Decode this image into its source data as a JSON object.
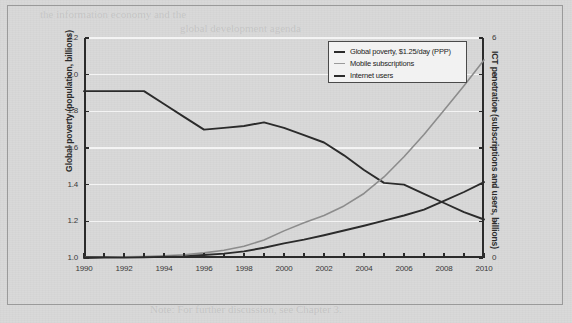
{
  "chart_data": {
    "type": "line",
    "title": "",
    "xlabel": "",
    "grid": "horizontal",
    "legend_position": "top-right",
    "x": [
      1990,
      1991,
      1992,
      1993,
      1994,
      1995,
      1996,
      1997,
      1998,
      1999,
      2000,
      2001,
      2002,
      2003,
      2004,
      2005,
      2006,
      2007,
      2008,
      2009,
      2010
    ],
    "xlim": [
      1990,
      2010
    ],
    "xticks": [
      1990,
      1992,
      1994,
      1996,
      1998,
      2000,
      2002,
      2004,
      2006,
      2008,
      2010
    ],
    "xtick_labels": [
      "1990",
      "1992",
      "1994",
      "1996",
      "1998",
      "2000",
      "2002",
      "2004",
      "2006",
      "2008",
      "2010"
    ],
    "axes": [
      {
        "id": "left",
        "label": "Global poverty (population, billions)",
        "lim": [
          1.0,
          2.2
        ],
        "ticks": [
          1.0,
          1.2,
          1.4,
          1.6,
          1.8,
          2.0,
          2.2
        ],
        "tick_labels": [
          "1.0",
          "1.2",
          "1.4",
          "1.6",
          "1.8",
          "2.0",
          "2.2"
        ]
      },
      {
        "id": "right",
        "label": "ICT penetration (subscriptions and users, billions)",
        "lim": [
          0,
          6
        ],
        "ticks": [
          0,
          1,
          2,
          3,
          4,
          5,
          6
        ],
        "tick_labels": [
          "0",
          "1",
          "2",
          "3",
          "4",
          "5",
          "6"
        ]
      }
    ],
    "series": [
      {
        "name": "Global poverty, $1.25/day (PPP)",
        "axis": "left",
        "color": "#2b2b2b",
        "width": 1.9,
        "values": [
          1.91,
          1.91,
          1.91,
          1.91,
          1.84,
          1.77,
          1.7,
          1.71,
          1.72,
          1.74,
          1.71,
          1.67,
          1.63,
          1.56,
          1.48,
          1.41,
          1.4,
          1.35,
          1.3,
          1.25,
          1.21
        ]
      },
      {
        "name": "Mobile subscriptions",
        "axis": "right",
        "color": "#8c8c8c",
        "width": 1.6,
        "values": [
          0.01,
          0.02,
          0.03,
          0.04,
          0.06,
          0.09,
          0.14,
          0.21,
          0.32,
          0.49,
          0.74,
          0.96,
          1.16,
          1.42,
          1.76,
          2.21,
          2.76,
          3.37,
          4.03,
          4.7,
          5.4
        ]
      },
      {
        "name": "Internet users",
        "axis": "right",
        "color": "#2b2b2b",
        "width": 1.9,
        "values": [
          0.0,
          0.01,
          0.01,
          0.02,
          0.03,
          0.04,
          0.08,
          0.12,
          0.18,
          0.28,
          0.4,
          0.5,
          0.62,
          0.75,
          0.88,
          1.02,
          1.16,
          1.32,
          1.56,
          1.8,
          2.07
        ]
      }
    ],
    "legend": [
      {
        "label": "Global poverty, $1.25/day (PPP)",
        "color": "#2b2b2b",
        "width": 2
      },
      {
        "label": "Mobile subscriptions",
        "color": "#9a9a9a",
        "width": 1.4
      },
      {
        "label": "Internet users",
        "color": "#2b2b2b",
        "width": 2.2
      }
    ]
  },
  "ghost_text": {
    "line1": "the information economy and the",
    "line2": "global development agenda",
    "bottom": "Note: For further discussion, see Chapter 3."
  }
}
